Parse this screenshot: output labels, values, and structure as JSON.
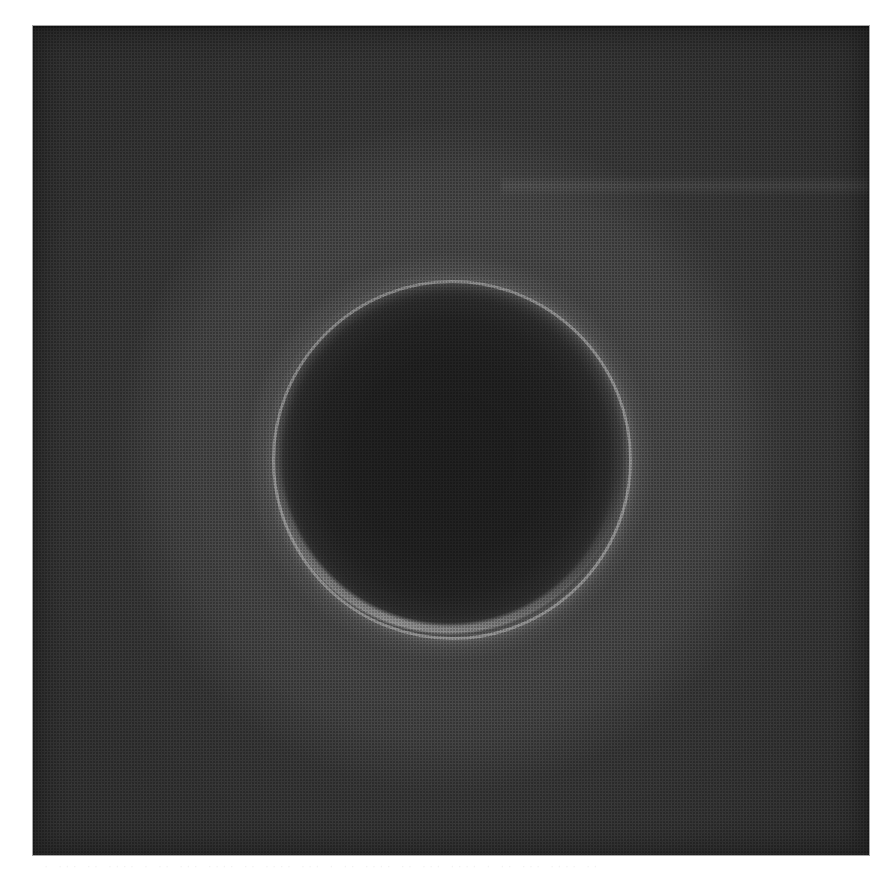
{
  "page": {
    "background_color": "#ffffff",
    "width": 894,
    "height": 883,
    "medium": "halftone-printed monochrome photographic plate on white paper"
  },
  "plate": {
    "label": "astronomical-photographic-plate",
    "left": 33,
    "top": 26,
    "width": 836,
    "height": 829,
    "base_color": "#2b2b2b",
    "corner_color": "#262626"
  },
  "subject": {
    "description": "Backlit dark circular body surrounded by a luminous rim and a broad diffuse halo",
    "dark_disk": {
      "name": "occulting-disk",
      "center_x": 449,
      "center_y": 457,
      "radius": 176,
      "fill_color": "#1e1e1e"
    },
    "luminous_rim": {
      "name": "limb-ring",
      "radius": 177,
      "thickness": 3,
      "peak_color": "#909090",
      "average_color": "#6a6a6a",
      "brightest_arc": "lower-left"
    },
    "outer_halo": {
      "name": "corona-halo",
      "radius": 330,
      "color": "#3c3c3c"
    }
  },
  "artifacts": {
    "streak": {
      "name": "emulsion-streak",
      "position": "right side, upper third",
      "color": "#4a4a4a"
    },
    "halftone": {
      "name": "halftone-screen",
      "cell_size_px": 3
    },
    "showthrough": {
      "name": "reverse-side-bleed-through",
      "color": "#f0f0f0",
      "legible": "no",
      "line_1": "· ··· ·· ···· · ·· ··· ···· ·· ···· ··· · ·· ···· ·· ··· ···· · ·· ··· ···· ··",
      "line_2": "··· · ···· ·· ··· · ···· ··· ·· · ···· ·· ··· ··· · ··· ·· ···· · ···"
    }
  }
}
